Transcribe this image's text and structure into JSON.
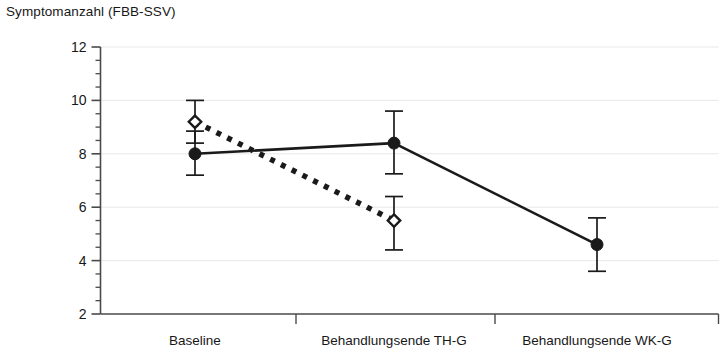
{
  "chart_data": {
    "type": "line",
    "title": "Symptomanzahl (FBB-SSV)",
    "xlabel": "",
    "ylabel": "",
    "categories": [
      "Baseline",
      "Behandlungsende TH-G",
      "Behandlungsende WK-G"
    ],
    "ylim": [
      2,
      12
    ],
    "y_ticks": [
      2,
      4,
      6,
      8,
      10,
      12
    ],
    "y_tick_labels": [
      "2",
      "4",
      "6",
      "8",
      "10",
      "12"
    ],
    "y_minor_tick_step": 0.5,
    "grid": "horizontal-major-only",
    "legend": "none",
    "series": [
      {
        "name": "WK-G",
        "marker": "filled-circle",
        "line_style": "solid",
        "x": [
          "Baseline",
          "Behandlungsende TH-G",
          "Behandlungsende WK-G"
        ],
        "values": [
          8.0,
          8.4,
          4.6
        ],
        "error_low": [
          7.2,
          7.25,
          3.6
        ],
        "error_high": [
          8.85,
          9.6,
          5.6
        ]
      },
      {
        "name": "TH-G",
        "marker": "open-diamond",
        "line_style": "thick-dotted",
        "x": [
          "Baseline",
          "Behandlungsende TH-G"
        ],
        "values": [
          9.2,
          5.5
        ],
        "error_low": [
          8.4,
          4.4
        ],
        "error_high": [
          10.0,
          6.4
        ]
      }
    ]
  },
  "colors": {
    "ink": "#1a1a1a",
    "axis": "#4a4a4a",
    "gridline": "#e8e8e8",
    "background": "#ffffff"
  }
}
